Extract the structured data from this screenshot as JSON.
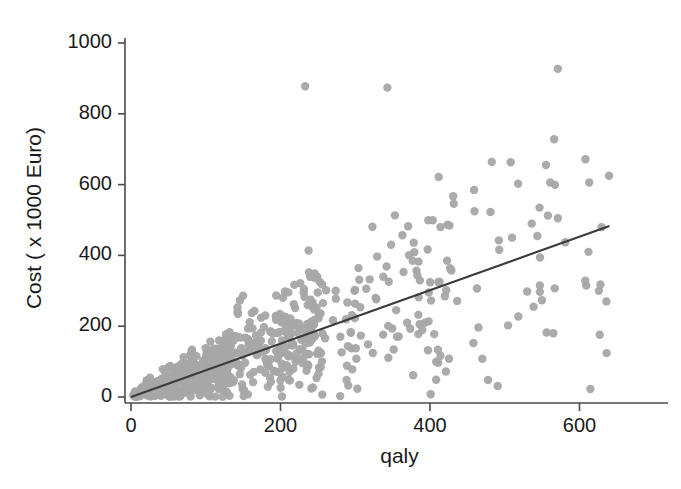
{
  "chart_data": {
    "type": "scatter",
    "title": "",
    "xlabel": "qaly",
    "ylabel": "Cost ( x 1000 Euro)",
    "xlim": [
      -18,
      690
    ],
    "ylim": [
      -30,
      1040
    ],
    "xticks": [
      0,
      200,
      400,
      600
    ],
    "xtick_labels": [
      "0",
      "200",
      "400",
      "600"
    ],
    "yticks": [
      0,
      200,
      400,
      600,
      800,
      1000
    ],
    "ytick_labels": [
      "0",
      "200",
      "400",
      "600",
      "800",
      "1000"
    ],
    "grid": false,
    "legend": null,
    "marker": {
      "shape": "circle",
      "radius_px": 4.2,
      "color": "#a6a6a6",
      "opacity": 0.95
    },
    "series": [
      {
        "name": "cost-per-qaly observations",
        "n_points": 760,
        "description": "Heteroscedastic fan-shaped cloud; variance of cost grows with qaly. Dense overlapping mass near origin, sparse scatter at high qaly.",
        "model": {
          "kind": "linear-with-proportional-noise",
          "slope": 0.76,
          "intercept": 0.0,
          "noise_sd_at_x": "0.34 * x",
          "x_distribution": "right-skewed, concentrated 0-250, tail to 670",
          "x_min": 2,
          "x_max": 670,
          "seed": 20240917
        }
      }
    ],
    "outliers": [
      {
        "x": 233,
        "y": 878
      },
      {
        "x": 343,
        "y": 874
      },
      {
        "x": 571,
        "y": 927
      },
      {
        "x": 566,
        "y": 728
      },
      {
        "x": 508,
        "y": 663
      },
      {
        "x": 571,
        "y": 505
      },
      {
        "x": 459,
        "y": 585
      },
      {
        "x": 431,
        "y": 567
      },
      {
        "x": 414,
        "y": 480
      },
      {
        "x": 323,
        "y": 481
      },
      {
        "x": 348,
        "y": 430
      },
      {
        "x": 581,
        "y": 437
      },
      {
        "x": 612,
        "y": 410
      },
      {
        "x": 238,
        "y": 352
      },
      {
        "x": 206,
        "y": 298
      },
      {
        "x": 150,
        "y": 286
      },
      {
        "x": 628,
        "y": 318
      },
      {
        "x": 609,
        "y": 315
      },
      {
        "x": 547,
        "y": 297
      },
      {
        "x": 530,
        "y": 298
      },
      {
        "x": 636,
        "y": 270
      },
      {
        "x": 556,
        "y": 182
      },
      {
        "x": 565,
        "y": 180
      },
      {
        "x": 627,
        "y": 176
      },
      {
        "x": 470,
        "y": 108
      },
      {
        "x": 411,
        "y": 97
      },
      {
        "x": 296,
        "y": 78
      },
      {
        "x": 251,
        "y": 66
      }
    ],
    "fit_line": {
      "name": "regression line",
      "type": "linear",
      "slope": 0.755,
      "intercept": 0,
      "x_start": 0,
      "x_end": 640,
      "y_start": 0,
      "y_end": 483,
      "color": "#3a3a3a",
      "width_px": 2.1
    },
    "style": {
      "background": "#ffffff",
      "axis_color": "#4a4a4a",
      "tick_color": "#4a4a4a",
      "text_color": "#1a1a1a",
      "point_color": "#a6a6a6",
      "line_color": "#3a3a3a"
    },
    "geometry": {
      "plot_left_px": 131,
      "plot_right_px": 668,
      "plot_top_px": 38,
      "plot_bottom_px": 397,
      "x_axis_y_px": 403,
      "y_axis_x_px": 125,
      "px_per_200_x": 149.5,
      "px_per_200_y": 70.8
    }
  }
}
